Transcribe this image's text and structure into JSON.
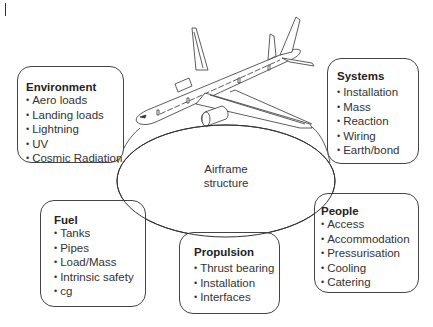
{
  "diagram": {
    "center": {
      "line1": "Airframe",
      "line2": "structure"
    },
    "boxes": {
      "environment": {
        "title": "Environment",
        "items": [
          "Aero loads",
          "Landing loads",
          "Lightning",
          "UV",
          "Cosmic Radiation"
        ]
      },
      "systems": {
        "title": "Systems",
        "items": [
          "Installation",
          "Mass",
          "Reaction",
          "Wiring",
          "Earth/bond"
        ]
      },
      "fuel": {
        "title": "Fuel",
        "items": [
          "Tanks",
          "Pipes",
          "Load/Mass",
          "Intrinsic safety",
          "cg"
        ]
      },
      "propulsion": {
        "title": "Propulsion",
        "items": [
          "Thrust bearing",
          "Installation",
          "Interfaces"
        ]
      },
      "people": {
        "title": "People",
        "items": [
          "Access",
          "Accommodation",
          "Pressurisation",
          "Cooling",
          "Catering"
        ]
      }
    },
    "colors": {
      "line": "#333333",
      "text": "#2a2a2a",
      "background": "#ffffff"
    }
  }
}
